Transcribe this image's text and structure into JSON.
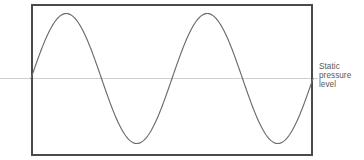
{
  "figure": {
    "background_color": "#ffffff",
    "width": 364,
    "height": 160,
    "frame": {
      "name": "plot-frame",
      "x": 31,
      "y": 4,
      "width": 282,
      "height": 152,
      "stroke_color": "#4a4a4d",
      "stroke_width": 2
    },
    "baseline": {
      "name": "static-pressure-line",
      "y": 78.5,
      "x_start": 0,
      "x_end": 318,
      "stroke_color": "#cfcfd1",
      "stroke_width": 1
    },
    "wave": {
      "name": "pressure-waveform",
      "stroke_color": "#6b6b6e",
      "stroke_width": 1,
      "cycles": 2,
      "x_start": 31,
      "x_end": 313,
      "baseline_y": 78.5,
      "peak_y": 14,
      "trough_y": 148,
      "amplitude": 65,
      "key_points": [
        {
          "label": "start-zero-crossing",
          "x": 31,
          "y": 78.5
        },
        {
          "label": "first-peak",
          "x": 85,
          "y": 14
        },
        {
          "label": "descending-zero-crossing",
          "x": 131,
          "y": 78.5
        },
        {
          "label": "trough",
          "x": 180,
          "y": 148
        },
        {
          "label": "ascending-zero-crossing",
          "x": 226,
          "y": 78.5
        },
        {
          "label": "second-peak",
          "x": 272,
          "y": 14
        },
        {
          "label": "end-zero-crossing",
          "x": 313,
          "y": 78.5
        }
      ]
    }
  },
  "annotation": {
    "name": "static-pressure-level-label",
    "color": "#59595b",
    "lines": [
      "Static",
      "pressure",
      "level"
    ],
    "full_text": "Static pressure level"
  },
  "chart_data": {
    "type": "line",
    "title": "",
    "xlabel": "",
    "ylabel": "",
    "xlim": [
      0,
      2
    ],
    "ylim": [
      -1,
      1
    ],
    "grid": false,
    "legend": null,
    "annotations": [
      {
        "text": "Static pressure level",
        "target": "y = 0 baseline",
        "position": "right"
      }
    ],
    "series": [
      {
        "name": "Sound pressure",
        "description": "Two full sine cycles about the static pressure level",
        "function": "sin(2*pi*x)",
        "x": [
          0,
          0.125,
          0.25,
          0.375,
          0.5,
          0.625,
          0.75,
          0.875,
          1.0,
          1.125,
          1.25,
          1.375,
          1.5,
          1.625,
          1.75,
          1.875,
          2.0
        ],
        "values": [
          0,
          0.707,
          1,
          0.707,
          0,
          -0.707,
          -1,
          -0.707,
          0,
          0.707,
          1,
          0.707,
          0,
          -0.707,
          -1,
          -0.707,
          0
        ]
      }
    ]
  }
}
